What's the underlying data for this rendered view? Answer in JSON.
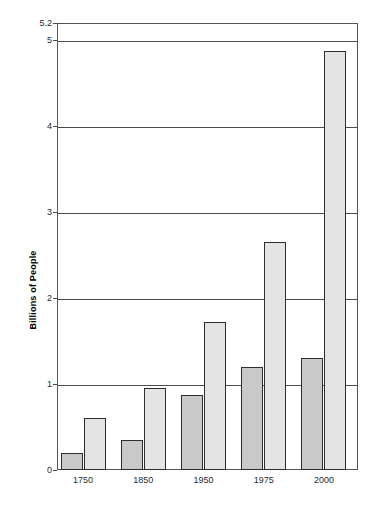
{
  "chart_data": {
    "type": "bar",
    "title": "",
    "xlabel": "",
    "ylabel": "Billions of People",
    "categories": [
      "1750",
      "1850",
      "1950",
      "1975",
      "2000"
    ],
    "series": [
      {
        "name": "series-1-dark",
        "color": "#c9c9c9",
        "values": [
          0.2,
          0.35,
          0.87,
          1.2,
          1.3
        ]
      },
      {
        "name": "series-2-light",
        "color": "#e3e3e3",
        "values": [
          0.6,
          0.95,
          1.72,
          2.65,
          4.88
        ]
      }
    ],
    "ylim": [
      0,
      5.2
    ],
    "y_ticks": [
      0,
      1,
      2,
      3,
      4,
      5,
      5.2
    ],
    "y_tick_labels": [
      "0",
      "1",
      "2",
      "3",
      "4",
      "5",
      "5.2"
    ],
    "gridlines": [
      1,
      2,
      3,
      4,
      5
    ],
    "grid": true,
    "legend": "none",
    "frame_color": "#555555",
    "gridline_color": "#4a4a4a",
    "background": "#ffffff"
  }
}
